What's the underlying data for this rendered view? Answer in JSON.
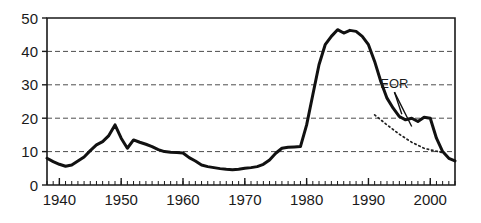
{
  "chart_data": {
    "type": "line",
    "title": "",
    "xlabel": "",
    "ylabel": "",
    "xlim": [
      1938,
      2004
    ],
    "ylim": [
      0,
      50
    ],
    "grid": "horizontal dashed gridlines at 10, 20, 30, 40",
    "legend": "none",
    "x_ticks": [
      "1940",
      "1950",
      "1960",
      "1970",
      "1980",
      "1990",
      "2000"
    ],
    "x_tick_values": [
      1940,
      1950,
      1960,
      1970,
      1980,
      1990,
      2000
    ],
    "y_ticks": [
      "0",
      "10",
      "20",
      "30",
      "40",
      "50"
    ],
    "y_tick_values": [
      0,
      10,
      20,
      30,
      40,
      50
    ],
    "minor_tick_interval": 1,
    "series": [
      {
        "name": "main-series",
        "style": "solid",
        "x": [
          1938,
          1939,
          1940,
          1941,
          1942,
          1943,
          1944,
          1945,
          1946,
          1947,
          1948,
          1949,
          1950,
          1951,
          1952,
          1953,
          1954,
          1955,
          1956,
          1957,
          1958,
          1959,
          1960,
          1961,
          1962,
          1963,
          1964,
          1965,
          1966,
          1967,
          1968,
          1969,
          1970,
          1971,
          1972,
          1973,
          1974,
          1975,
          1976,
          1977,
          1978,
          1979,
          1980,
          1981,
          1982,
          1983,
          1984,
          1985,
          1986,
          1987,
          1988,
          1989,
          1990,
          1991,
          1992,
          1993,
          1994,
          1995,
          1996,
          1997,
          1998,
          1999,
          2000,
          2001,
          2002,
          2003,
          2004
        ],
        "y": [
          8.0,
          7.0,
          6.2,
          5.6,
          6.0,
          7.2,
          8.4,
          10.3,
          12.0,
          13.0,
          14.8,
          18.0,
          14.0,
          11.0,
          13.5,
          12.8,
          12.2,
          11.5,
          10.6,
          10.0,
          9.8,
          9.7,
          9.6,
          8.2,
          7.2,
          6.0,
          5.5,
          5.2,
          4.9,
          4.7,
          4.6,
          4.7,
          5.0,
          5.2,
          5.5,
          6.2,
          7.5,
          9.5,
          11.0,
          11.3,
          11.4,
          11.5,
          18.0,
          27.0,
          36.0,
          42.0,
          44.5,
          46.5,
          45.5,
          46.3,
          46.0,
          44.5,
          42.0,
          37.0,
          31.0,
          26.0,
          23.0,
          20.5,
          19.5,
          20.0,
          19.0,
          20.3,
          20.0,
          14.0,
          10.0,
          8.0,
          7.2
        ]
      },
      {
        "name": "eor-dotted-series",
        "style": "dotted",
        "x": [
          1991,
          1993,
          1995,
          1997,
          1999,
          2001,
          2002
        ],
        "y": [
          21.0,
          18.0,
          15.2,
          12.8,
          11.0,
          10.1,
          9.7
        ]
      }
    ],
    "annotations": [
      {
        "name": "eor-label",
        "text": "EOR",
        "x": 1994.2,
        "y": 29.0,
        "leader_targets": [
          {
            "x": 1995.4,
            "y": 21.2
          },
          {
            "x": 1997.0,
            "y": 17.5
          }
        ]
      }
    ]
  },
  "colors": {
    "background": "#ffffff",
    "axis": "#1a1a1a",
    "series": "#111111",
    "grid": "#4d4d4d"
  }
}
